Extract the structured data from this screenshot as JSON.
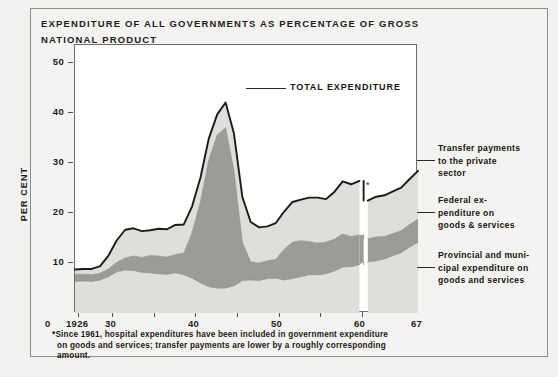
{
  "figure": {
    "title": "EXPENDITURE OF ALL GOVERNMENTS AS PERCENTAGE OF GROSS NATIONAL PRODUCT",
    "footnote_marker": "*",
    "footnote_line1": "Since 1961, hospital expenditures have been included in government expenditure",
    "footnote_line2": "on goods and services; transfer payments are lower by a roughly corresponding",
    "footnote_line3": "amount.",
    "colors": {
      "page_background": "#f2f1ef",
      "panel_background": "#f4f3f1",
      "plot_background": "#ffffff",
      "border": "#6e6c68",
      "outline": "#1a1a16",
      "band_light": "#dededa",
      "band_dark": "#9b9b97",
      "text": "#1c1c1c"
    }
  },
  "axes": {
    "ylabel": "PER CENT",
    "yticks": [
      "10",
      "20",
      "30",
      "40",
      "50"
    ],
    "yvalues": [
      10,
      20,
      30,
      40,
      50
    ],
    "ylim": [
      0,
      56
    ],
    "origin_label": "0",
    "xticks_labeled": [
      "1926",
      "30",
      "40",
      "50",
      "60",
      "67"
    ],
    "xtick_values": [
      1926,
      1930,
      1940,
      1950,
      1960,
      1967
    ],
    "xlim": [
      1926,
      1967
    ],
    "xtick_minor_step": 5,
    "grid": "off"
  },
  "callouts": {
    "total_expenditure": "TOTAL EXPENDITURE",
    "transfer_payments": "Transfer payments\nto the private\nsector",
    "federal": "Federal ex-\npenditure on\ngoods & services",
    "provincial": "Provincial and muni-\ncipal expenditure on\ngoods and services",
    "break_marker": "*"
  },
  "chart_data": {
    "type": "area",
    "stacked": true,
    "title": "EXPENDITURE OF ALL GOVERNMENTS AS PERCENTAGE OF GROSS NATIONAL PRODUCT",
    "xlabel": "",
    "ylabel": "PER CENT",
    "xlim": [
      1926,
      1967
    ],
    "ylim": [
      0,
      56
    ],
    "grid": "off",
    "legend_position": "right-callouts",
    "annotations": [
      {
        "text": "TOTAL EXPENDITURE",
        "x": 1943.5,
        "y": 47.5
      },
      {
        "text": "*",
        "x": 1961,
        "y": 24.5,
        "note": "series break: hospital expenditure reclassified in 1961"
      }
    ],
    "x": [
      1926,
      1927,
      1928,
      1929,
      1930,
      1931,
      1932,
      1933,
      1934,
      1935,
      1936,
      1937,
      1938,
      1939,
      1940,
      1941,
      1942,
      1943,
      1944,
      1945,
      1946,
      1947,
      1948,
      1949,
      1950,
      1951,
      1952,
      1953,
      1954,
      1955,
      1956,
      1957,
      1958,
      1959,
      1960,
      1961,
      1962,
      1963,
      1964,
      1965,
      1966,
      1967
    ],
    "series": [
      {
        "name": "Provincial and municipal expenditure on goods and services",
        "color": "#dededa",
        "values": [
          6.6,
          6.7,
          6.6,
          6.9,
          7.6,
          8.6,
          9.0,
          8.9,
          8.5,
          8.4,
          8.2,
          8.1,
          8.4,
          8.0,
          7.3,
          6.3,
          5.5,
          5.2,
          5.2,
          5.7,
          6.8,
          6.9,
          6.8,
          7.2,
          7.3,
          6.9,
          7.2,
          7.6,
          8.0,
          8.0,
          8.2,
          8.8,
          9.6,
          9.7,
          10.1,
          10.7,
          10.9,
          11.3,
          12.0,
          12.6,
          13.8,
          14.8
        ]
      },
      {
        "name": "Federal expenditure on goods & services",
        "color": "#9b9b97",
        "values": [
          1.5,
          1.4,
          1.4,
          1.4,
          1.6,
          2.0,
          2.5,
          3.0,
          3.1,
          3.6,
          3.7,
          3.6,
          3.8,
          4.5,
          9.5,
          17.0,
          26.5,
          32.0,
          33.5,
          24.0,
          8.0,
          3.8,
          3.6,
          3.7,
          3.9,
          6.4,
          7.6,
          7.5,
          6.9,
          6.6,
          6.6,
          6.6,
          6.9,
          6.3,
          6.2,
          4.8,
          5.0,
          4.7,
          4.6,
          4.6,
          4.7,
          4.8
        ]
      },
      {
        "name": "Transfer payments to the private sector",
        "color": "#dededa",
        "values": [
          1.0,
          1.1,
          1.2,
          1.5,
          2.8,
          4.6,
          5.9,
          5.8,
          5.5,
          5.3,
          5.7,
          5.8,
          6.2,
          6.0,
          5.5,
          5.0,
          4.5,
          4.3,
          5.3,
          7.8,
          9.5,
          8.3,
          7.5,
          7.2,
          7.6,
          7.9,
          8.4,
          8.6,
          9.2,
          9.5,
          9.0,
          9.9,
          11.0,
          10.9,
          11.3,
          8.0,
          8.4,
          8.6,
          8.8,
          9.0,
          9.5,
          10.1
        ]
      }
    ],
    "total_expenditure": [
      9.1,
      9.2,
      9.2,
      9.8,
      12.0,
      15.2,
      17.4,
      17.7,
      17.1,
      17.3,
      17.6,
      17.5,
      18.4,
      18.5,
      22.3,
      28.3,
      36.5,
      41.5,
      44.0,
      37.5,
      24.3,
      19.0,
      17.9,
      18.1,
      18.8,
      21.2,
      23.2,
      23.7,
      24.1,
      24.1,
      23.8,
      25.3,
      27.5,
      26.9,
      27.6,
      23.5,
      24.3,
      24.6,
      25.4,
      26.2,
      28.0,
      29.7
    ]
  }
}
